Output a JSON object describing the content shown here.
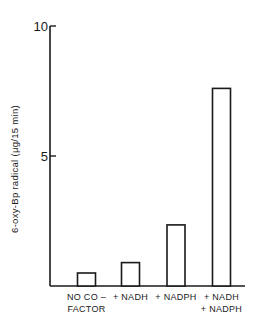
{
  "chart_data": {
    "type": "bar",
    "title": "",
    "xlabel": "",
    "ylabel": "6-oxy-Bp radical (μg/15 min)",
    "ylim": [
      0,
      10
    ],
    "yticks": [
      5,
      10
    ],
    "ytick_labels": [
      "5",
      "10"
    ],
    "grid": false,
    "legend": "none",
    "categories": [
      [
        "NO CO –",
        "FACTOR"
      ],
      [
        "+ NADH"
      ],
      [
        "+ NADPH"
      ],
      [
        "+ NADH",
        "+ NADPH"
      ]
    ],
    "values": [
      0.5,
      0.9,
      2.35,
      7.6
    ],
    "colors": {
      "bar_fill": "#ffffff",
      "stroke": "#1a1a1a"
    }
  }
}
